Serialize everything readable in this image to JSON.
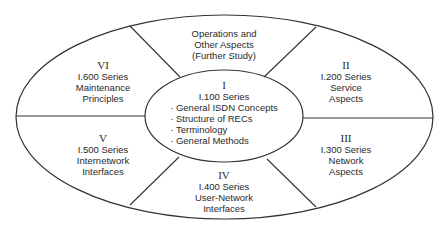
{
  "diagram": {
    "stroke_color": "#333333",
    "center": {
      "roman": "I",
      "series": "I.100 Series",
      "items": [
        "General ISDN Concepts",
        "Structure of RECs",
        "Terminology",
        "General Methods"
      ]
    },
    "top": {
      "lines": [
        "Operations and",
        "Other Aspects",
        "(Further Study)"
      ]
    },
    "segments": [
      {
        "roman": "II",
        "series": "I.200 Series",
        "lines": [
          "Service",
          "Aspects"
        ]
      },
      {
        "roman": "III",
        "series": "I.300 Series",
        "lines": [
          "Network",
          "Aspects"
        ]
      },
      {
        "roman": "IV",
        "series": "I.400 Series",
        "lines": [
          "User-Network",
          "Interfaces"
        ]
      },
      {
        "roman": "V",
        "series": "I.500 Series",
        "lines": [
          "Internetwork",
          "Interfaces"
        ]
      },
      {
        "roman": "VI",
        "series": "I.600 Series",
        "lines": [
          "Maintenance",
          "Principles"
        ]
      }
    ]
  }
}
